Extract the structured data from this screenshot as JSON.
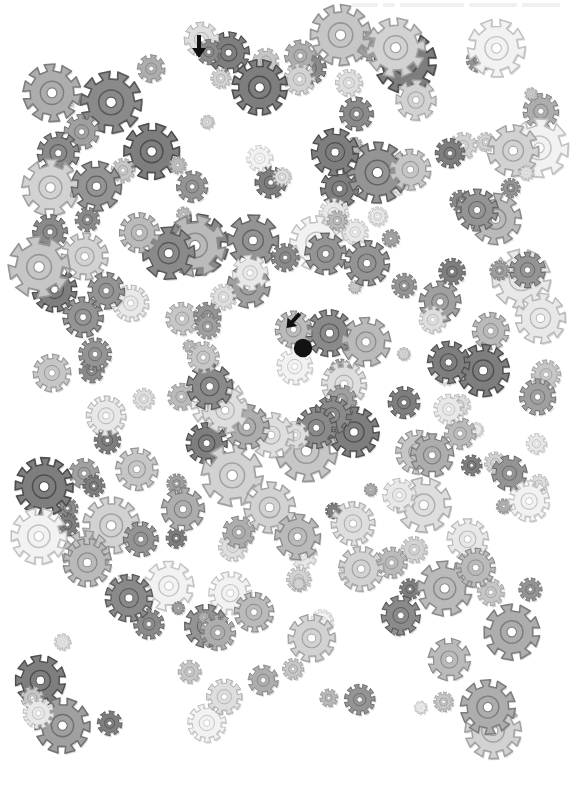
{
  "canvas": {
    "width": 570,
    "height": 787,
    "background": "#ffffff",
    "title": "Gear Field Visual Search Image"
  },
  "header": {
    "faint_text": "",
    "visible": true,
    "note": "partially cropped faint header strip at top-right"
  },
  "field": {
    "name": "scattered-gears-field",
    "left": 28,
    "top": 28,
    "right": 546,
    "bottom": 752,
    "pattern": "spiral-swirl",
    "gear_count": 318,
    "palette": [
      "#f2f2f2",
      "#e8e8e8",
      "#dedede",
      "#d2d2d2",
      "#c6c6c6",
      "#bababa",
      "#adadad",
      "#a0a0a0",
      "#949494",
      "#8a8a8a",
      "#7e7e7e"
    ],
    "outline_color": "#8f8f8f",
    "hub_color": "#9a9a9a",
    "size_range_px": [
      13,
      62
    ],
    "tooth_range": [
      8,
      12
    ]
  },
  "markers": {
    "items": [
      {
        "name": "arrow-marker-top",
        "icon": "arrow-down-icon",
        "x": 199,
        "y": 47,
        "rotation_deg": 0,
        "color": "#111111",
        "size": 22
      },
      {
        "name": "arrow-marker-center",
        "icon": "arrow-down-left-icon",
        "x": 292,
        "y": 320,
        "rotation_deg": 40,
        "color": "#111111",
        "size": 20
      },
      {
        "name": "dot-marker-center",
        "icon": "filled-circle-icon",
        "x": 303,
        "y": 348,
        "radius": 9,
        "color": "#111111"
      }
    ]
  },
  "gears": {
    "seed": 20240517,
    "rows": [
      {
        "y": 52,
        "count": 19
      },
      {
        "y": 96,
        "count": 20
      },
      {
        "y": 140,
        "count": 20
      },
      {
        "y": 184,
        "count": 21
      },
      {
        "y": 228,
        "count": 20
      },
      {
        "y": 272,
        "count": 20
      },
      {
        "y": 316,
        "count": 19
      },
      {
        "y": 360,
        "count": 19
      },
      {
        "y": 404,
        "count": 20
      },
      {
        "y": 448,
        "count": 20
      },
      {
        "y": 492,
        "count": 20
      },
      {
        "y": 536,
        "count": 20
      },
      {
        "y": 580,
        "count": 20
      },
      {
        "y": 624,
        "count": 20
      },
      {
        "y": 668,
        "count": 20
      },
      {
        "y": 712,
        "count": 20
      }
    ]
  }
}
